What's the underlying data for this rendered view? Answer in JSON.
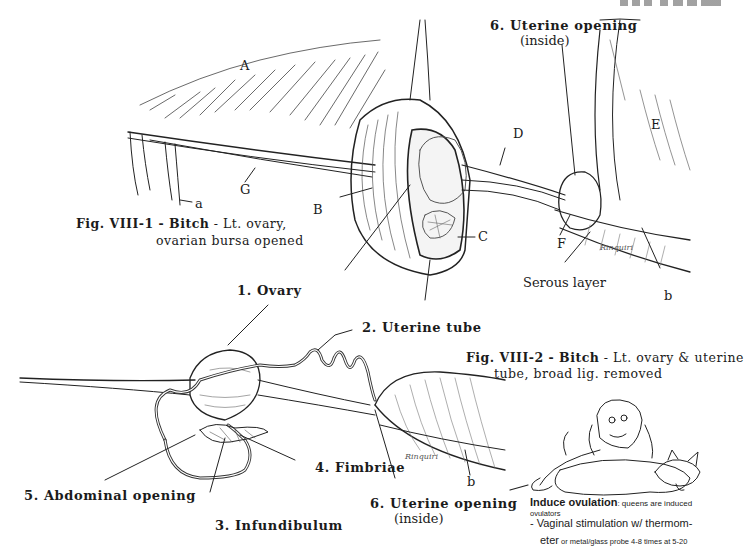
{
  "page_header": "322 Fig. VIII",
  "figure1": {
    "caption_bold": "Fig. VIII-1 - Bitch",
    "caption_rest": " - Lt. ovary,",
    "caption_line2": "ovarian bursa opened",
    "letters": {
      "A": "A",
      "B": "B",
      "C": "C",
      "D": "D",
      "E": "E",
      "F": "F",
      "G": "G",
      "a": "a",
      "b": "b"
    },
    "labels": {
      "uterine_opening": "6. Uterine opening",
      "uterine_opening_sub": "(inside)",
      "serous_layer": "Serous layer",
      "signature": "Rinquiri"
    }
  },
  "figure2": {
    "caption_bold": "Fig. VIII-2 - Bitch",
    "caption_rest": " - Lt. ovary & uterine",
    "caption_line2": "tube, broad lig. removed",
    "labels": {
      "ovary": "1. Ovary",
      "uterine_tube": "2. Uterine tube",
      "infundibulum": "3. Infundibulum",
      "fimbriae": "4. Fimbriae",
      "abdominal_opening": "5. Abdominal opening",
      "uterine_opening": "6. Uterine opening",
      "uterine_opening_sub": "(inside)",
      "b": "b",
      "signature": "Rinquiri"
    }
  },
  "cartoon_note": {
    "title": "Induce ovulation",
    "title_rest": ": queens are induced",
    "line2": "ovulators",
    "bullet1": "- Vaginal stimulation w/ thermom-",
    "bullet1_cont_big": "eter",
    "bullet1_cont_small": " or metal/glass probe 4-8 times at 5-20"
  }
}
